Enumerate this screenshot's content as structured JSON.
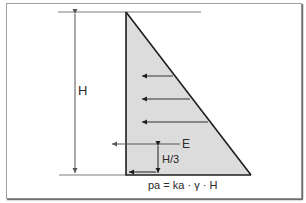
{
  "diagram": {
    "labels": {
      "height": "H",
      "resultant_force": "E",
      "resultant_height": "H/3",
      "formula": "pa = ka · γ · H"
    },
    "colors": {
      "frame": "#9a9a9a",
      "frame_shadow": "#7a7a7a",
      "fill": "#dcdcdc",
      "stroke": "#1e1e1e",
      "reference_line": "#a8a8a8",
      "dim_line": "#555555",
      "text": "#2a2a2a"
    },
    "pressure_arrows_count": 3
  }
}
